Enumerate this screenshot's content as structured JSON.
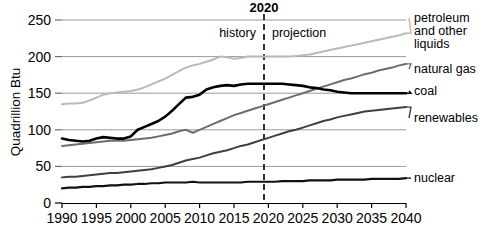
{
  "chart_data": {
    "type": "line",
    "title": "2020",
    "xlabel": "",
    "ylabel": "Quadrillion Btu",
    "xlim": [
      1990,
      2040
    ],
    "ylim": [
      0,
      250
    ],
    "grid": true,
    "legend_position": "right-inline-labels",
    "xticks": [
      "1990",
      "1995",
      "2000",
      "2005",
      "2010",
      "2015",
      "2020",
      "2025",
      "2030",
      "2035",
      "2040"
    ],
    "yticks": [
      "0",
      "50",
      "100",
      "150",
      "200",
      "250"
    ],
    "annotations": {
      "divider_year": "2020",
      "history_label": "history",
      "projection_label": "projection"
    },
    "x": [
      1990,
      1991,
      1992,
      1993,
      1994,
      1995,
      1996,
      1997,
      1998,
      1999,
      2000,
      2001,
      2002,
      2003,
      2004,
      2005,
      2006,
      2007,
      2008,
      2009,
      2010,
      2011,
      2012,
      2013,
      2014,
      2015,
      2016,
      2017,
      2018,
      2019,
      2020,
      2021,
      2022,
      2023,
      2024,
      2025,
      2026,
      2027,
      2028,
      2029,
      2030,
      2031,
      2032,
      2033,
      2034,
      2035,
      2036,
      2037,
      2038,
      2039,
      2040
    ],
    "series": [
      {
        "name": "petroleum and other liquids",
        "label": "petroleum and other liquids",
        "color": "#b9b9b9",
        "values": [
          135,
          136,
          136,
          137,
          140,
          144,
          148,
          150,
          151,
          152,
          153,
          155,
          158,
          162,
          166,
          170,
          175,
          180,
          185,
          188,
          190,
          193,
          196,
          200,
          199,
          197,
          198,
          200,
          200,
          200,
          200,
          200,
          200,
          200,
          201,
          202,
          203,
          205,
          207,
          209,
          211,
          213,
          215,
          217,
          219,
          221,
          223,
          225,
          227,
          229,
          232
        ]
      },
      {
        "name": "natural gas",
        "label": "natural gas",
        "color": "#6d6d6d",
        "values": [
          78,
          79,
          80,
          81,
          82,
          83,
          84,
          85,
          85,
          85,
          86,
          87,
          88,
          89,
          91,
          93,
          95,
          98,
          100,
          96,
          100,
          104,
          108,
          112,
          116,
          120,
          123,
          126,
          129,
          132,
          135,
          138,
          141,
          144,
          147,
          150,
          153,
          156,
          159,
          162,
          165,
          168,
          170,
          173,
          176,
          178,
          181,
          183,
          185,
          188,
          190
        ]
      },
      {
        "name": "coal",
        "label": "coal",
        "color": "#000000",
        "values": [
          88,
          86,
          85,
          84,
          85,
          88,
          90,
          89,
          88,
          88,
          91,
          100,
          104,
          108,
          112,
          118,
          126,
          135,
          144,
          145,
          148,
          155,
          158,
          160,
          161,
          160,
          162,
          163,
          163,
          163,
          163,
          163,
          163,
          162,
          161,
          160,
          158,
          157,
          155,
          154,
          152,
          151,
          150,
          150,
          150,
          150,
          150,
          150,
          150,
          150,
          150
        ]
      },
      {
        "name": "renewables",
        "label": "renewables",
        "color": "#3f3f3f",
        "values": [
          35,
          36,
          36,
          37,
          38,
          39,
          40,
          41,
          41,
          42,
          43,
          44,
          45,
          46,
          48,
          50,
          52,
          55,
          58,
          60,
          62,
          65,
          68,
          70,
          72,
          75,
          78,
          80,
          83,
          86,
          89,
          92,
          95,
          98,
          100,
          103,
          106,
          109,
          112,
          114,
          117,
          119,
          121,
          123,
          125,
          126,
          127,
          128,
          129,
          130,
          131
        ]
      },
      {
        "name": "nuclear",
        "label": "nuclear",
        "color": "#111111",
        "values": [
          20,
          21,
          21,
          22,
          22,
          23,
          23,
          24,
          24,
          25,
          25,
          26,
          26,
          27,
          27,
          28,
          28,
          28,
          28,
          29,
          28,
          28,
          28,
          28,
          28,
          28,
          28,
          29,
          29,
          29,
          29,
          29,
          30,
          30,
          30,
          30,
          31,
          31,
          31,
          31,
          32,
          32,
          32,
          32,
          32,
          33,
          33,
          33,
          33,
          33,
          34
        ]
      }
    ]
  }
}
